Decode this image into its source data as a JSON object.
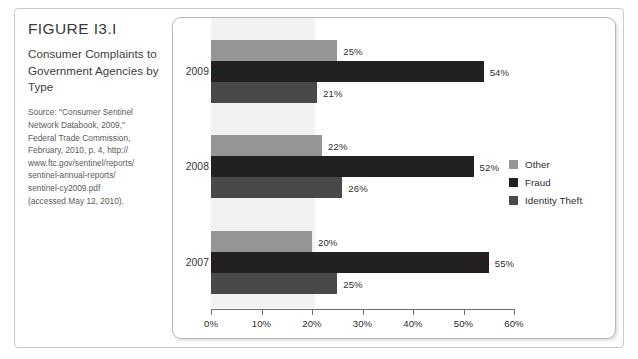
{
  "figure": {
    "number": "FIGURE I3.I",
    "title": "Consumer Complaints to Government Agencies by Type",
    "source_lines": [
      "Source: \"Consumer Sentinel",
      "Network Databook, 2009,\"",
      "Federal Trade Commission,",
      "February, 2010, p. 4, http://",
      "www.ftc.gov/sentinel/reports/",
      "sentinel-annual-reports/",
      "sentinel-cy2009.pdf",
      "(accessed May 12, 2010)."
    ]
  },
  "chart_data": {
    "type": "bar",
    "orientation": "horizontal",
    "title": "Consumer Complaints to Government Agencies by Type",
    "xlabel": "",
    "ylabel": "",
    "xlim": [
      0,
      60
    ],
    "xtick_labels": [
      "0%",
      "10%",
      "20%",
      "30%",
      "40%",
      "50%",
      "60%"
    ],
    "xticks": [
      0,
      10,
      20,
      30,
      40,
      50,
      60
    ],
    "grid": false,
    "legend_position": "right",
    "categories": [
      "2009",
      "2008",
      "2007"
    ],
    "series": [
      {
        "name": "Other",
        "color": "#959595",
        "values": [
          25,
          22,
          20
        ],
        "labels": [
          "25%",
          "22%",
          "20%"
        ]
      },
      {
        "name": "Fraud",
        "color": "#232021",
        "values": [
          54,
          52,
          55
        ],
        "labels": [
          "54%",
          "52%",
          "55%"
        ]
      },
      {
        "name": "Identity Theft",
        "color": "#4a4849",
        "values": [
          21,
          26,
          25
        ],
        "labels": [
          "21%",
          "26%",
          "25%"
        ]
      }
    ],
    "groups": [
      {
        "category": "2009",
        "bars": [
          {
            "series": "Other",
            "value": 25,
            "label": "25%"
          },
          {
            "series": "Fraud",
            "value": 54,
            "label": "54%"
          },
          {
            "series": "Identity Theft",
            "value": 21,
            "label": "21%"
          }
        ]
      },
      {
        "category": "2008",
        "bars": [
          {
            "series": "Other",
            "value": 22,
            "label": "22%"
          },
          {
            "series": "Fraud",
            "value": 52,
            "label": "52%"
          },
          {
            "series": "Identity Theft",
            "value": 26,
            "label": "26%"
          }
        ]
      },
      {
        "category": "2007",
        "bars": [
          {
            "series": "Other",
            "value": 20,
            "label": "20%"
          },
          {
            "series": "Fraud",
            "value": 55,
            "label": "55%"
          },
          {
            "series": "Identity Theft",
            "value": 25,
            "label": "25%"
          }
        ]
      }
    ]
  },
  "legend": {
    "items": [
      {
        "label": "Other",
        "color": "#959595"
      },
      {
        "label": "Fraud",
        "color": "#232021"
      },
      {
        "label": "Identity Theft",
        "color": "#4a4849"
      }
    ]
  }
}
